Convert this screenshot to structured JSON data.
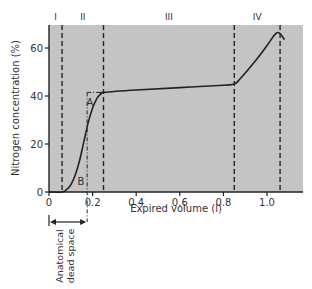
{
  "chart_data": {
    "type": "line",
    "title": "",
    "xlabel": "Expired volume (l)",
    "ylabel": "Nitrogen concentration (%)",
    "xlim": [
      0,
      1.16
    ],
    "ylim": [
      0,
      70
    ],
    "x_ticks": [
      0,
      0.2,
      0.4,
      0.6,
      0.8,
      1.0
    ],
    "x_tick_labels": [
      "0",
      "0.2",
      "0.4",
      "0.6",
      "0.8",
      "1.0"
    ],
    "y_ticks": [
      0,
      20,
      40,
      60
    ],
    "y_tick_labels": [
      "0",
      "20",
      "40",
      "60"
    ],
    "grid": false,
    "background": "#c4c4c4",
    "line_color": "#222222",
    "series": [
      {
        "name": "Nitrogen concentration",
        "x": [
          0.0,
          0.06,
          0.08,
          0.1,
          0.12,
          0.14,
          0.16,
          0.18,
          0.2,
          0.22,
          0.24,
          0.25,
          0.4,
          0.6,
          0.8,
          0.85,
          0.88,
          0.95,
          1.0,
          1.04,
          1.06,
          1.08
        ],
        "y": [
          0,
          0,
          1,
          3,
          7,
          13,
          21,
          29,
          35,
          39,
          41,
          41.5,
          42.5,
          43.5,
          44.5,
          45,
          47.5,
          55,
          61,
          66,
          66,
          63.5
        ]
      }
    ],
    "phase_boundaries": [
      0.06,
      0.25,
      0.85,
      1.06
    ],
    "phases": [
      {
        "label": "I",
        "x": 0.03
      },
      {
        "label": "II",
        "x": 0.155
      },
      {
        "label": "III",
        "x": 0.55
      },
      {
        "label": "IV",
        "x": 0.955
      }
    ],
    "annotations": [
      {
        "label": "A",
        "x": 0.19,
        "y": 36
      },
      {
        "label": "B",
        "x": 0.145,
        "y": 3
      },
      {
        "label": "Anatomical dead space",
        "x_start": 0,
        "x_end": 0.175
      }
    ],
    "dead_space_volume": 0.175,
    "dead_space_label_line1": "Anatomical",
    "dead_space_label_line2": "dead space"
  }
}
